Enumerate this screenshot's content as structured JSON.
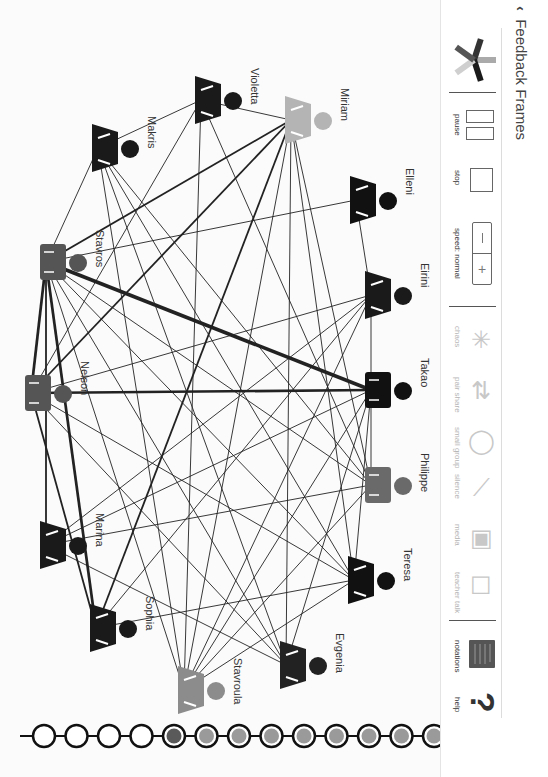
{
  "header": {
    "back_label": "<",
    "title": "Feedback Frames"
  },
  "toolbar": {
    "pause_label": "pause",
    "stop_label": "stop",
    "speed_label": "speed: normal",
    "speed_minus": "−",
    "speed_plus": "+",
    "modes": [
      {
        "label": "chaos",
        "icon": "chaos-arrows-icon",
        "enabled": false
      },
      {
        "label": "pair share",
        "icon": "pair-share-arrows-icon",
        "enabled": false
      },
      {
        "label": "small group",
        "icon": "small-group-circle-icon",
        "enabled": false
      },
      {
        "label": "silence",
        "icon": "silence-slash-icon",
        "enabled": false
      },
      {
        "label": "media",
        "icon": "media-film-icon",
        "enabled": false
      },
      {
        "label": "teacher talk",
        "icon": "teacher-talk-icon",
        "enabled": false
      }
    ],
    "notations_label": "notations",
    "help_label": "help",
    "help_glyph": "?"
  },
  "students": [
    {
      "name": "Violetta",
      "shape": "female",
      "color": "#1a1a1a",
      "x": 215,
      "y": 100
    },
    {
      "name": "Miriam",
      "shape": "female",
      "color": "#b4b4b4",
      "x": 305,
      "y": 120
    },
    {
      "name": "Makris",
      "shape": "female",
      "color": "#1a1a1a",
      "x": 112,
      "y": 148
    },
    {
      "name": "Elleni",
      "shape": "female",
      "color": "#111111",
      "x": 370,
      "y": 200
    },
    {
      "name": "Stavros",
      "shape": "male",
      "color": "#555555",
      "x": 60,
      "y": 262
    },
    {
      "name": "Eirini",
      "shape": "female",
      "color": "#1a1a1a",
      "x": 385,
      "y": 295
    },
    {
      "name": "Nelson",
      "shape": "male",
      "color": "#555555",
      "x": 45,
      "y": 393
    },
    {
      "name": "Takao",
      "shape": "male",
      "color": "#111111",
      "x": 385,
      "y": 390
    },
    {
      "name": "Philippe",
      "shape": "male",
      "color": "#6a6a6a",
      "x": 385,
      "y": 485
    },
    {
      "name": "Marina",
      "shape": "female",
      "color": "#1a1a1a",
      "x": 60,
      "y": 545
    },
    {
      "name": "Teresa",
      "shape": "female",
      "color": "#111111",
      "x": 368,
      "y": 580
    },
    {
      "name": "Sophia",
      "shape": "female",
      "color": "#1a1a1a",
      "x": 110,
      "y": 628
    },
    {
      "name": "Evgenia",
      "shape": "female",
      "color": "#222222",
      "x": 300,
      "y": 665
    },
    {
      "name": "Stavroula",
      "shape": "female",
      "color": "#8c8c8c",
      "x": 198,
      "y": 690
    }
  ],
  "timeline": {
    "frames": [
      {
        "state": "empty"
      },
      {
        "state": "empty"
      },
      {
        "state": "empty"
      },
      {
        "state": "empty"
      },
      {
        "state": "current"
      },
      {
        "state": "filled"
      },
      {
        "state": "filled"
      },
      {
        "state": "filled"
      },
      {
        "state": "filled"
      },
      {
        "state": "filled"
      },
      {
        "state": "filled"
      },
      {
        "state": "filled"
      },
      {
        "state": "filled"
      },
      {
        "state": "filled"
      }
    ]
  },
  "colors": {
    "accent_dark": "#111111",
    "mid_gray": "#555555",
    "light_gray": "#b4b4b4",
    "frame_fill": "#9a9a9a",
    "frame_current": "#5a5a5a"
  }
}
